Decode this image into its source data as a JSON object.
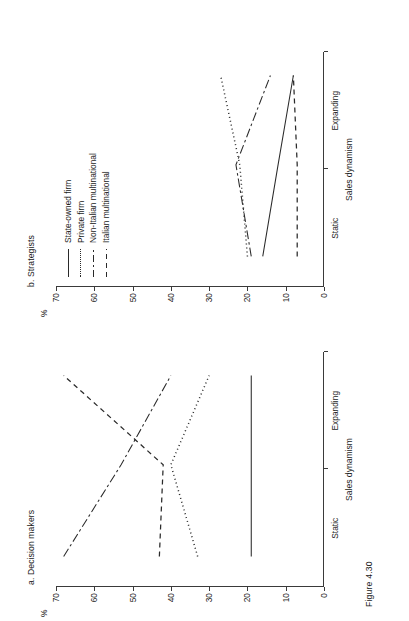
{
  "figure": {
    "caption": "Figure 4.30",
    "percent_symbol": "%"
  },
  "legend": {
    "entries": [
      {
        "label": "State-owned firm",
        "style": "solid"
      },
      {
        "label": "Private firm",
        "style": "dotted"
      },
      {
        "label": "Non-Italian multinational",
        "style": "dashdot"
      },
      {
        "label": "Italian multinational",
        "style": "dashed"
      }
    ]
  },
  "panels": {
    "a": {
      "title": "a. Decision makers"
    },
    "b": {
      "title": "b. Strategists"
    }
  },
  "axis": {
    "y_label": "%",
    "y_ticks": [
      "0",
      "10",
      "20",
      "30",
      "40",
      "50",
      "60",
      "70"
    ],
    "x_title": "Sales dynamism",
    "x_ticks": [
      "Static",
      "Expanding"
    ]
  },
  "chart_data": [
    {
      "type": "line",
      "title": "a. Decision makers",
      "xlabel": "Sales dynamism",
      "ylabel": "%",
      "ylim": [
        0,
        70
      ],
      "grid": false,
      "legend_position": "top-right (shared, shown on panel b)",
      "categories": [
        "Static",
        "Medium",
        "Expanding"
      ],
      "series": [
        {
          "name": "State-owned firm",
          "style": "solid",
          "values": [
            19,
            19,
            19
          ]
        },
        {
          "name": "Private firm",
          "style": "dotted",
          "values": [
            33,
            40,
            30
          ]
        },
        {
          "name": "Non-Italian multinational",
          "style": "dashdot",
          "values": [
            68,
            53,
            40
          ]
        },
        {
          "name": "Italian multinational",
          "style": "dashed",
          "values": [
            43,
            42,
            68
          ]
        }
      ]
    },
    {
      "type": "line",
      "title": "b. Strategists",
      "xlabel": "Sales dynamism",
      "ylabel": "%",
      "ylim": [
        0,
        70
      ],
      "grid": false,
      "legend_position": "top-right",
      "categories": [
        "Static",
        "Medium",
        "Expanding"
      ],
      "series": [
        {
          "name": "State-owned firm",
          "style": "solid",
          "values": [
            16,
            12,
            8
          ]
        },
        {
          "name": "Private firm",
          "style": "dotted",
          "values": [
            20,
            22,
            27
          ]
        },
        {
          "name": "Non-Italian multinational",
          "style": "dashdot",
          "values": [
            19,
            23,
            14
          ]
        },
        {
          "name": "Italian multinational",
          "style": "dashed",
          "values": [
            7,
            7,
            8
          ]
        }
      ]
    }
  ]
}
